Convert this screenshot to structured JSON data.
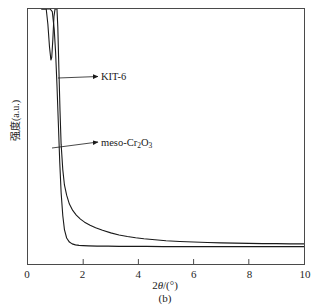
{
  "figure": {
    "caption": "(b)",
    "x_axis_title_prefix": "2",
    "x_axis_title_theta": "θ",
    "x_axis_title_suffix": "/(°)",
    "y_axis_title": "强度(a.u.)",
    "frame_color": "#4a4a4a",
    "curve_color": "#1a1a1a"
  },
  "annotations": [
    {
      "name": "kit6",
      "label_prefix": "KIT-6",
      "label_sub": "",
      "label_suffix": ""
    },
    {
      "name": "meso",
      "label_prefix": "meso-Cr",
      "label_sub": "2",
      "label_mid": "O",
      "label_sub2": "3"
    }
  ],
  "chart_data": {
    "type": "line",
    "title": "",
    "subtitle": "",
    "xlabel": "2θ/(°)",
    "ylabel": "强度(a.u.)",
    "xlim": [
      0,
      10
    ],
    "ylim": [
      0,
      100
    ],
    "xticks": [
      0,
      2,
      4,
      6,
      8,
      10
    ],
    "xtick_labels": [
      "0",
      "2",
      "4",
      "6",
      "8",
      "10"
    ],
    "yticks": [],
    "ytick_labels": [],
    "grid": false,
    "legend": "none",
    "annotations": [
      {
        "text": "KIT-6",
        "x": 3.4,
        "y": 73,
        "arrow_to_x": 1.2,
        "arrow_to_y": 73
      },
      {
        "text": "meso-Cr2O3",
        "x": 3.4,
        "y": 48,
        "arrow_to_x": 1.05,
        "arrow_to_y": 41
      }
    ],
    "series": [
      {
        "name": "KIT-6",
        "color": "#1a1a1a",
        "x": [
          0.5,
          0.6,
          0.66,
          0.72,
          0.78,
          0.83,
          0.86,
          0.9,
          0.94,
          0.98,
          1.02,
          1.05,
          1.08,
          1.12,
          1.16,
          1.2,
          1.26,
          1.32,
          1.4,
          1.5,
          1.62,
          1.75,
          1.9,
          2.05,
          2.25,
          2.45,
          2.7,
          3.0,
          3.3,
          3.6,
          3.9,
          4.2,
          4.6,
          5.0,
          5.5,
          6.0,
          6.5,
          7.0,
          7.5,
          8.0,
          8.5,
          9.0,
          9.5,
          10.0
        ],
        "y": [
          100,
          100,
          100,
          94,
          85,
          80,
          81,
          88,
          97,
          100,
          100,
          100,
          93,
          76,
          60,
          47,
          37,
          31,
          27,
          23.5,
          21,
          19.2,
          17.6,
          16.4,
          15.2,
          14.2,
          13.2,
          12.2,
          11.4,
          10.8,
          10.3,
          9.9,
          9.5,
          9.1,
          8.8,
          8.6,
          8.4,
          8.3,
          8.2,
          8.1,
          8.0,
          8.0,
          7.9,
          7.9
        ]
      },
      {
        "name": "meso-Cr2O3",
        "color": "#1a1a1a",
        "x": [
          0.5,
          0.6,
          0.7,
          0.8,
          0.88,
          0.95,
          1.0,
          1.05,
          1.1,
          1.15,
          1.2,
          1.26,
          1.32,
          1.4,
          1.5,
          1.6,
          1.72,
          1.85,
          2.0,
          2.2,
          2.5,
          2.9,
          3.3,
          3.8,
          4.3,
          4.9,
          5.5,
          6.2,
          7.0,
          7.8,
          8.6,
          9.3,
          10.0
        ],
        "y": [
          100,
          100,
          100,
          100,
          99,
          92,
          83,
          70,
          55,
          40,
          28,
          19,
          13.5,
          10.2,
          8.6,
          7.9,
          7.5,
          7.3,
          7.2,
          7.1,
          7.0,
          7.0,
          6.9,
          6.9,
          6.9,
          6.8,
          6.8,
          6.8,
          6.8,
          6.8,
          6.8,
          6.8,
          6.8
        ]
      }
    ]
  }
}
